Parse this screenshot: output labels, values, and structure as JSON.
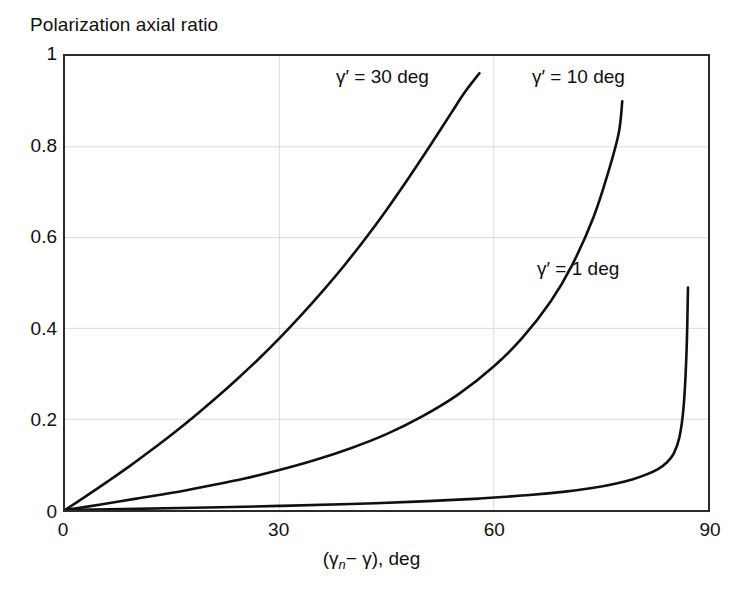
{
  "figure": {
    "title": "Polarization axial ratio",
    "background_color": "#ffffff",
    "frame_color": "#2b2b2b",
    "grid_color": "#dcdcdc",
    "curve_color": "#101010"
  },
  "axes": {
    "x": {
      "title_prefix": "(",
      "title_gamma_n": "γ",
      "title_sub_n": "n",
      "title_minus": "−",
      "title_gamma": "γ",
      "title_suffix": "),  deg",
      "full_label": "(γn− γ),  deg",
      "ticks": [
        "0",
        "30",
        "60",
        "90"
      ],
      "tick_values": [
        0,
        30,
        60,
        90
      ],
      "min": 0,
      "max": 90
    },
    "y": {
      "ticks": [
        "0",
        "0.2",
        "0.4",
        "0.6",
        "0.8",
        "1"
      ],
      "tick_values": [
        0,
        0.2,
        0.4,
        0.6,
        0.8,
        1
      ],
      "min": 0,
      "max": 1
    }
  },
  "annotations": [
    {
      "id": "g30",
      "text": "γ′ = 30 deg"
    },
    {
      "id": "g10",
      "text": "γ′ = 10 deg"
    },
    {
      "id": "g1",
      "text": "γ′ = 1 deg"
    }
  ],
  "chart_data": {
    "type": "line",
    "title": "Polarization axial ratio",
    "xlabel": "(γn − γ),  deg",
    "ylabel": "Polarization axial ratio",
    "xlim": [
      0,
      90
    ],
    "ylim": [
      0,
      1
    ],
    "xticks": [
      0,
      30,
      60,
      90
    ],
    "yticks": [
      0,
      0.2,
      0.4,
      0.6,
      0.8,
      1
    ],
    "grid": true,
    "legend": "inline-annotations",
    "series": [
      {
        "name": "γ′ = 30 deg",
        "color": "#101010",
        "x": [
          0,
          3,
          6,
          9,
          12,
          15,
          18,
          21,
          24,
          27,
          30,
          33,
          36,
          39,
          42,
          45,
          48,
          51,
          54,
          56,
          58
        ],
        "y": [
          0.0,
          0.031,
          0.063,
          0.096,
          0.131,
          0.167,
          0.205,
          0.245,
          0.287,
          0.331,
          0.378,
          0.428,
          0.481,
          0.537,
          0.597,
          0.661,
          0.729,
          0.8,
          0.873,
          0.921,
          0.962
        ]
      },
      {
        "name": "γ′ = 10 deg",
        "color": "#101010",
        "x": [
          0,
          5,
          10,
          15,
          20,
          25,
          30,
          35,
          40,
          45,
          50,
          55,
          60,
          64,
          68,
          71,
          74,
          76,
          77.5,
          78
        ],
        "y": [
          0.0,
          0.012,
          0.025,
          0.038,
          0.053,
          0.069,
          0.088,
          0.11,
          0.136,
          0.167,
          0.206,
          0.254,
          0.316,
          0.379,
          0.46,
          0.54,
          0.646,
          0.742,
          0.83,
          0.9
        ]
      },
      {
        "name": "γ′ = 1 deg",
        "color": "#101010",
        "x": [
          0,
          10,
          20,
          30,
          40,
          50,
          58,
          65,
          70,
          74,
          77,
          79.5,
          81.5,
          83,
          84.2,
          85.2,
          86,
          86.6,
          87,
          87.2
        ],
        "y": [
          0.0,
          0.0026,
          0.0055,
          0.009,
          0.0132,
          0.019,
          0.0252,
          0.033,
          0.0405,
          0.049,
          0.058,
          0.068,
          0.079,
          0.09,
          0.104,
          0.124,
          0.16,
          0.23,
          0.35,
          0.49
        ]
      }
    ]
  }
}
